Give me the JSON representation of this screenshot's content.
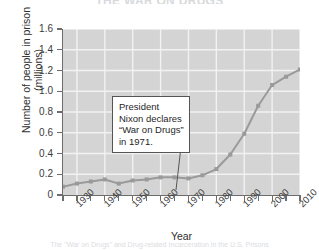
{
  "figure": {
    "title": "THE WAR ON DRUGS",
    "caption": "The \"War on Drugs\" and Drug-related Incarceration in the U.S. Prisons"
  },
  "chart_data": {
    "type": "line",
    "title": "",
    "xlabel": "Year",
    "ylabel": "Number of people in prison\n(millions)",
    "xlim": [
      1925,
      2010
    ],
    "ylim": [
      0,
      1.6
    ],
    "grid": true,
    "legend": "none",
    "marker": "square",
    "line_color": "#9a9a9a",
    "marker_color": "#9a9a9a",
    "plot_background": "#d4d4d4",
    "gridline_color": "#f2f2f2",
    "ytick_labels": [
      "1.6",
      "1.4",
      "1.2",
      "1.0",
      "0.8",
      "0.6",
      "0.4",
      "0.2",
      "0"
    ],
    "ytick_values": [
      1.6,
      1.4,
      1.2,
      1.0,
      0.8,
      0.6,
      0.4,
      0.2,
      0
    ],
    "xtick_labels": [
      "1930",
      "1940",
      "1950",
      "1960",
      "1970",
      "1980",
      "1990",
      "2000",
      "2010"
    ],
    "xtick_values": [
      1930,
      1940,
      1950,
      1960,
      1970,
      1980,
      1990,
      2000,
      2010
    ],
    "x": [
      1925,
      1930,
      1935,
      1940,
      1945,
      1950,
      1955,
      1960,
      1965,
      1970,
      1975,
      1980,
      1985,
      1990,
      1995,
      2000,
      2005,
      2010
    ],
    "values": [
      0.08,
      0.11,
      0.13,
      0.15,
      0.11,
      0.14,
      0.15,
      0.17,
      0.17,
      0.16,
      0.19,
      0.25,
      0.39,
      0.59,
      0.86,
      1.06,
      1.14,
      1.21
    ],
    "series_name": "People in prison (millions)",
    "annotations": [
      {
        "text": "President Nixon declares “War on Drugs” in 1971.",
        "points_to_year": 1971,
        "points_to_value": 0.16
      }
    ]
  }
}
